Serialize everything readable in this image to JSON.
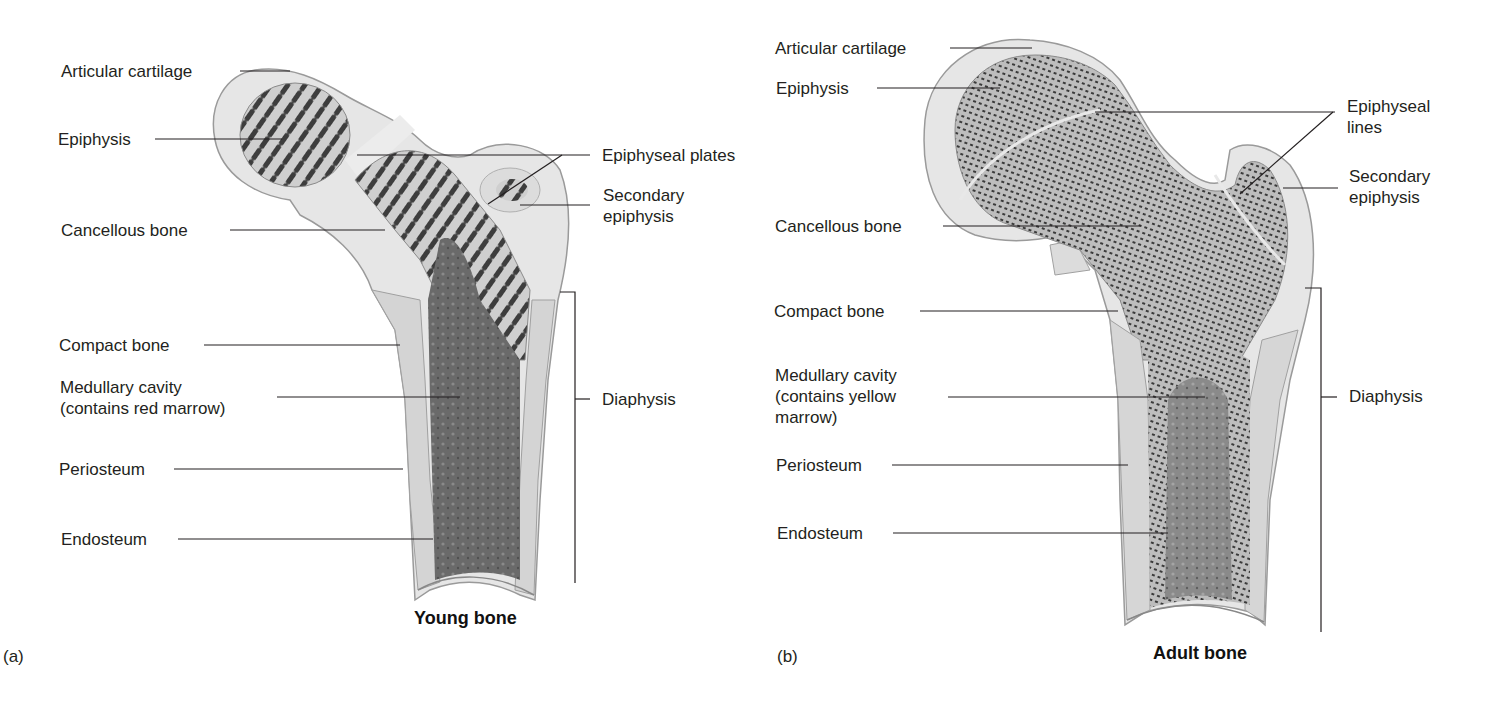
{
  "figure": {
    "panels": [
      {
        "id": "a",
        "panel_label": "(a)",
        "caption": "Young bone",
        "labels": {
          "articular_cartilage": "Articular cartilage",
          "epiphysis": "Epiphysis",
          "cancellous_bone": "Cancellous bone",
          "compact_bone": "Compact bone",
          "medullary_cavity": "Medullary cavity\n(contains red marrow)",
          "periosteum": "Periosteum",
          "endosteum": "Endosteum",
          "epiphyseal_plates": "Epiphyseal plates",
          "secondary_epiphysis": "Secondary\nepiphysis",
          "diaphysis": "Diaphysis"
        }
      },
      {
        "id": "b",
        "panel_label": "(b)",
        "caption": "Adult bone",
        "labels": {
          "articular_cartilage": "Articular cartilage",
          "epiphysis": "Epiphysis",
          "cancellous_bone": "Cancellous bone",
          "compact_bone": "Compact bone",
          "medullary_cavity": "Medullary cavity\n(contains yellow\nmarrow)",
          "periosteum": "Periosteum",
          "endosteum": "Endosteum",
          "epiphyseal_lines": "Epiphyseal\nlines",
          "secondary_epiphysis": "Secondary\nepiphysis",
          "diaphysis": "Diaphysis"
        }
      }
    ],
    "colors": {
      "background": "#ffffff",
      "text": "#231f20",
      "leader_line": "#231f20",
      "cartilage": "#e4e4e4",
      "compact_bone": "#d6d6d6",
      "cancellous_dark": "#4a4a4a",
      "marrow": "#6e6e6e"
    }
  }
}
